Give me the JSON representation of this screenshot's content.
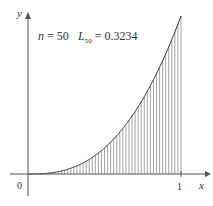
{
  "chart_data": {
    "type": "area",
    "title": "",
    "annotation": {
      "n_label": "n = 50",
      "L_label": "L",
      "L_sub": "50",
      "L_value": "= 0.3234"
    },
    "xlabel": "x",
    "ylabel": "y",
    "xticks": [
      "0",
      "1"
    ],
    "xlim": [
      0,
      1
    ],
    "ylim": [
      0,
      1
    ],
    "function": "y = x^3 (approx)",
    "n_rectangles": 50,
    "rule": "left endpoint",
    "estimate": 0.3234,
    "grid": false,
    "legend": null
  },
  "colors": {
    "axis": "#555555",
    "bars": "#666666",
    "curve": "#333333"
  }
}
